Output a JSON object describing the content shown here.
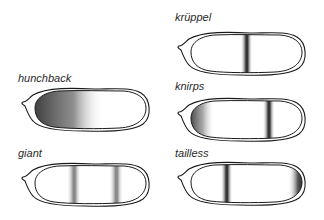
{
  "figure": {
    "embryos": [
      {
        "id": "hunchback",
        "label": "hunchback",
        "pattern": "anterior gradient",
        "stripes": [],
        "anterior_gradient": true,
        "posterior_cap": false
      },
      {
        "id": "kruppel",
        "label": "krüppel",
        "pattern": "central band",
        "stripes": [
          0.5
        ],
        "anterior_gradient": false,
        "posterior_cap": false
      },
      {
        "id": "knirps",
        "label": "knirps",
        "pattern": "anterior domain + posterior band",
        "stripes": [
          0.7
        ],
        "anterior_gradient": "weak",
        "posterior_cap": false
      },
      {
        "id": "giant",
        "label": "giant",
        "pattern": "two bands",
        "stripes": [
          0.35,
          0.73
        ],
        "anterior_gradient": false,
        "posterior_cap": false
      },
      {
        "id": "tailless",
        "label": "tailless",
        "pattern": "anterior band + posterior cap",
        "stripes": [
          0.32
        ],
        "anterior_gradient": false,
        "posterior_cap": true
      }
    ],
    "colors": {
      "outline": "#1a1a1a",
      "stain_dark": "#2b2b2b",
      "background": "#ffffff"
    }
  }
}
